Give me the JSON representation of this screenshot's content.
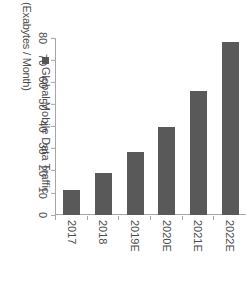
{
  "chart_data": {
    "type": "bar",
    "orientation": "horizontal",
    "title": "",
    "xlabel": "(Exabytes / Month)",
    "ylabel": "",
    "categories": [
      "2017",
      "2018",
      "2019E",
      "2020E",
      "2021E",
      "2022E"
    ],
    "series": [
      {
        "name": "Global Mobile Data Traffic",
        "values": [
          11.5,
          19,
          28.5,
          40,
          56,
          78
        ]
      }
    ],
    "xlim": [
      0,
      80
    ],
    "xticks": [
      80,
      70,
      60,
      50,
      40,
      30,
      20,
      10,
      0
    ],
    "xtick_labels": [
      "80",
      "70",
      "60",
      "50",
      "40",
      "30",
      "20",
      "10",
      "0"
    ],
    "grid": false,
    "legend_position": "top-left",
    "bar_color": "#595959",
    "axis_color": "#a6a6a6",
    "text_color": "#4d4d4d"
  },
  "axis": {
    "title": "(Exabytes / Month)"
  },
  "legend": {
    "items": [
      {
        "label": "Global Mobile Data Traffic",
        "color": "#595959",
        "marker": "square-marker"
      }
    ]
  }
}
